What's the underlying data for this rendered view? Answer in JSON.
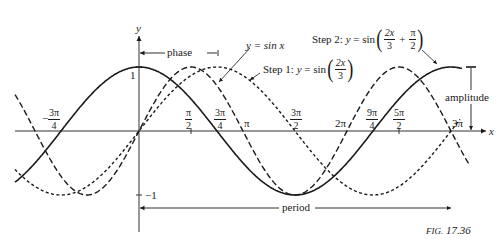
{
  "figure": {
    "caption_prefix": "FIG.",
    "caption_number": "17.36"
  },
  "axes": {
    "x_label": "x",
    "y_label": "y",
    "y_tick_pos": "1",
    "y_tick_neg": "−1"
  },
  "x_ticks": [
    {
      "id": "neg3pi4",
      "sign": "−",
      "num": "3π",
      "den": "4"
    },
    {
      "id": "pi2",
      "num": "π",
      "den": "2"
    },
    {
      "id": "3pi4",
      "num": "3π",
      "den": "4"
    },
    {
      "id": "pi",
      "text": "π"
    },
    {
      "id": "3pi2",
      "num": "3π",
      "den": "2"
    },
    {
      "id": "2pi",
      "text": "2π"
    },
    {
      "id": "9pi4",
      "num": "9π",
      "den": "4"
    },
    {
      "id": "5pi2",
      "num": "5π",
      "den": "2"
    },
    {
      "id": "3pi",
      "text": "3π"
    }
  ],
  "annotations": {
    "phase": "phase",
    "amplitude": "amplitude",
    "period": "period",
    "sin_label": "y  =  sin x",
    "step1_prefix": "Step 1:",
    "step1_y": "y",
    "step1_eq": "=",
    "step1_fn": "sin",
    "step1_num": "2x",
    "step1_den": "3",
    "step2_prefix": "Step 2:",
    "step2_y": "y",
    "step2_eq": "=",
    "step2_fn": "sin",
    "step2_num": "2x",
    "step2_den": "3",
    "step2_plus": "+",
    "step2_num2": "π",
    "step2_den2": "2"
  },
  "chart_data": {
    "type": "line",
    "title": "FIG. 17.36",
    "xlabel": "x",
    "ylabel": "y",
    "xlim": [
      -4.2,
      10.1
    ],
    "ylim": [
      -1,
      1
    ],
    "x_tick_labels": [
      "-3π/4",
      "π/2",
      "3π/4",
      "π",
      "3π/2",
      "2π",
      "9π/4",
      "5π/2",
      "3π"
    ],
    "y_tick_labels": [
      "1",
      "-1"
    ],
    "grid": false,
    "series": [
      {
        "name": "y = sin x",
        "style": "long-dash",
        "formula": "sin(x)",
        "zeros": [
          "0",
          "π",
          "2π",
          "3π"
        ],
        "max_at": "π/2",
        "min_at": "3π/2"
      },
      {
        "name": "Step 1: y = sin(2x/3)",
        "style": "short-dash",
        "formula": "sin(2x/3)",
        "zeros": [
          "0",
          "3π/2",
          "3π"
        ],
        "max_at": "3π/4",
        "min_at": "9π/4"
      },
      {
        "name": "Step 2: y = sin(2x/3 + π/2)",
        "style": "solid",
        "formula": "sin(2x/3 + π/2)",
        "zeros": [
          "-3π/4",
          "3π/4",
          "9π/4"
        ],
        "max_at": "0",
        "min_at": "3π/2"
      }
    ],
    "annotations": [
      "phase (from 0 to 3π/4)",
      "amplitude (1)",
      "period (from 0 to 3π)"
    ]
  }
}
